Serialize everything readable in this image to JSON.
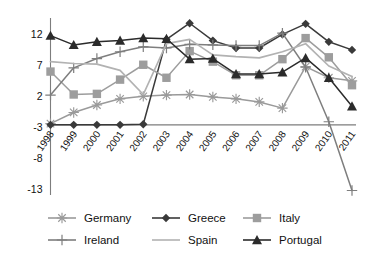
{
  "chart_data": {
    "type": "line",
    "title": "",
    "xlabel": "",
    "ylabel": "",
    "categories": [
      "1998",
      "1999",
      "2000",
      "2001",
      "2002",
      "2003",
      "2004",
      "2005",
      "2006",
      "2007",
      "2008",
      "2009",
      "2010",
      "2011"
    ],
    "ylim": [
      -13,
      14
    ],
    "yticks": [
      12,
      7,
      2,
      -3,
      -8,
      -13
    ],
    "ytick_labels": [
      "12",
      "7",
      "2",
      "-3",
      "-8",
      "-13"
    ],
    "grid": false,
    "legend_position": "bottom",
    "series": [
      {
        "name": "Germany",
        "marker": "asterisk",
        "color": "#9a9a9a",
        "values": [
          -2.4,
          -0.6,
          0.6,
          1.6,
          2.0,
          2.2,
          2.3,
          1.9,
          1.6,
          1.1,
          0.1,
          6.8,
          5.0,
          4.5
        ]
      },
      {
        "name": "Greece",
        "marker": "diamond",
        "color": "#3a3a3a",
        "values": [
          -2.6,
          -2.6,
          -2.6,
          -2.6,
          -2.5,
          11.2,
          13.8,
          11.0,
          9.8,
          9.8,
          12.0,
          13.7,
          10.8,
          9.5
        ]
      },
      {
        "name": "Italy",
        "marker": "square",
        "color": "#9d9d9d",
        "values": [
          6.0,
          2.3,
          2.4,
          4.7,
          7.1,
          5.0,
          9.3,
          7.6,
          5.4,
          5.4,
          8.0,
          11.4,
          8.3,
          3.8
        ]
      },
      {
        "name": "Ireland",
        "marker": "plus",
        "color": "#7e7e7e",
        "values": [
          2.2,
          6.6,
          8.1,
          9.2,
          10.0,
          9.8,
          10.4,
          10.3,
          10.2,
          10.2,
          12.2,
          6.7,
          -2.1,
          -13.2
        ]
      },
      {
        "name": "Spain",
        "marker": "none",
        "color": "#b2b2b2",
        "values": [
          7.6,
          7.3,
          7.2,
          6.2,
          2.3,
          10.5,
          11.2,
          8.7,
          8.4,
          8.2,
          9.2,
          10.5,
          6.9,
          5.2
        ]
      },
      {
        "name": "Portugal",
        "marker": "triangle",
        "color": "#2b2b2b",
        "values": [
          11.8,
          10.3,
          10.8,
          11.0,
          11.4,
          11.3,
          8.0,
          8.1,
          5.6,
          5.6,
          5.9,
          8.2,
          5.0,
          0.4
        ]
      }
    ]
  },
  "legend": {
    "entries": [
      {
        "label": "Germany",
        "marker": "asterisk",
        "color": "#9a9a9a"
      },
      {
        "label": "Greece",
        "marker": "diamond",
        "color": "#3a3a3a"
      },
      {
        "label": "Italy",
        "marker": "square",
        "color": "#9d9d9d"
      },
      {
        "label": "Ireland",
        "marker": "plus",
        "color": "#7e7e7e"
      },
      {
        "label": "Spain",
        "marker": "none",
        "color": "#b2b2b2"
      },
      {
        "label": "Portugal",
        "marker": "triangle",
        "color": "#2b2b2b"
      }
    ]
  }
}
